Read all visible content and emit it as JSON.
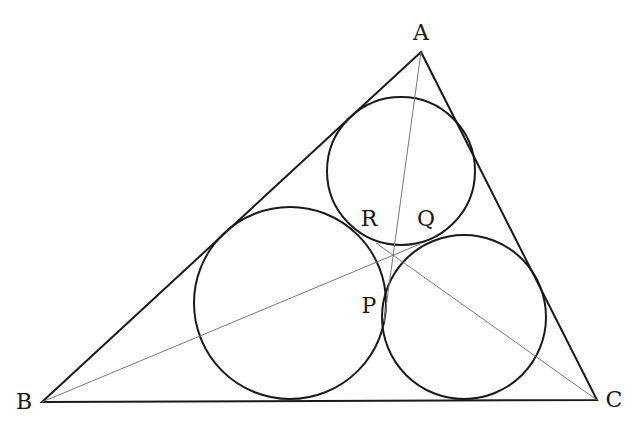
{
  "diagram": {
    "type": "geometry",
    "stroke_color": "#1a1a1a",
    "thin_color": "#777777",
    "triangle": {
      "A": [
        421,
        52
      ],
      "B": [
        42,
        402
      ],
      "C": [
        597,
        400
      ]
    },
    "circles": [
      {
        "name": "top-circle",
        "cx": 401,
        "cy": 171,
        "r": 74
      },
      {
        "name": "left-circle",
        "cx": 290,
        "cy": 303,
        "r": 96
      },
      {
        "name": "right-circle",
        "cx": 464,
        "cy": 317,
        "r": 82
      }
    ],
    "cevians": [
      {
        "name": "cevian-a-p",
        "from": [
          421,
          52
        ],
        "to": [
          384,
          322
        ]
      },
      {
        "name": "cevian-b-q",
        "from": [
          42,
          402
        ],
        "to": [
          420,
          244
        ]
      },
      {
        "name": "cevian-c-r",
        "from": [
          597,
          400
        ],
        "to": [
          376,
          243
        ]
      }
    ],
    "labels": [
      {
        "name": "label-a",
        "text": "A",
        "x": 421,
        "y": 33
      },
      {
        "name": "label-b",
        "text": "B",
        "x": 24,
        "y": 402
      },
      {
        "name": "label-c",
        "text": "C",
        "x": 614,
        "y": 400
      },
      {
        "name": "label-p",
        "text": "P",
        "x": 369,
        "y": 306
      },
      {
        "name": "label-q",
        "text": "Q",
        "x": 426,
        "y": 219
      },
      {
        "name": "label-r",
        "text": "R",
        "x": 369,
        "y": 219
      }
    ]
  }
}
